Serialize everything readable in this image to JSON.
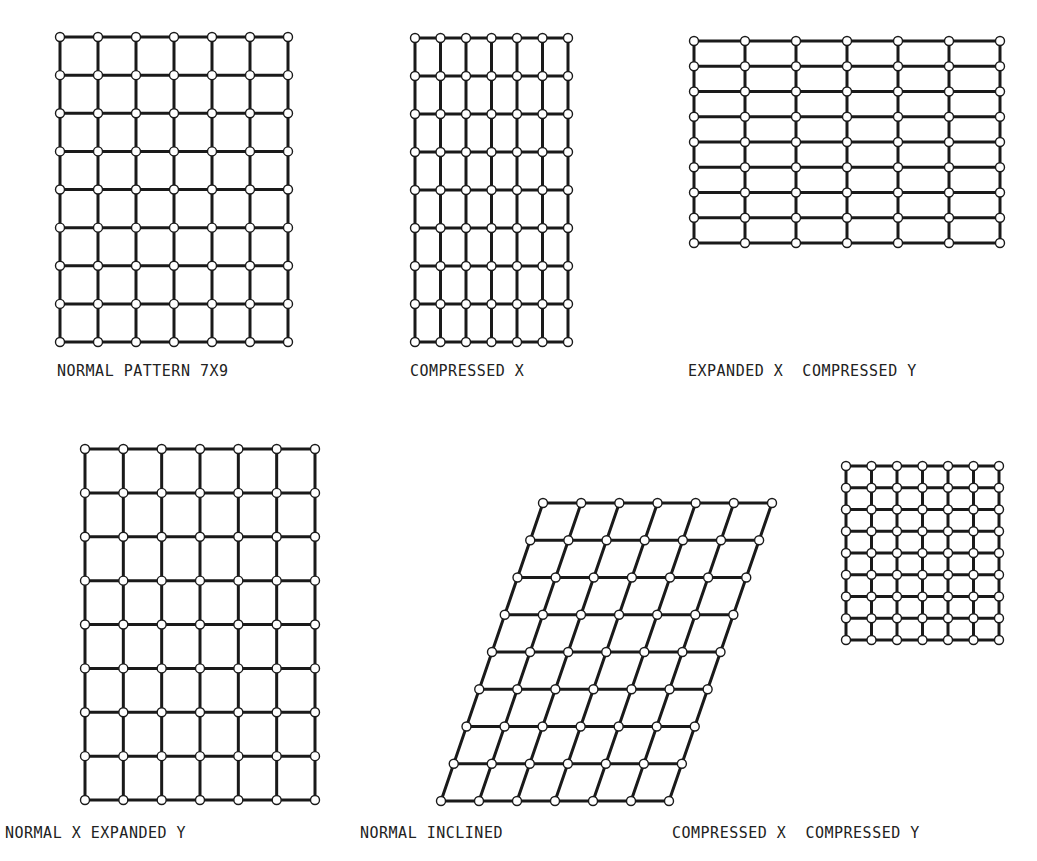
{
  "figure": {
    "colors": {
      "line": "#1a1a1a",
      "dot_fill": "#ffffff",
      "background": "#ffffff"
    },
    "grid": {
      "cols": 7,
      "rows": 9
    },
    "panels": [
      {
        "id": "normal",
        "label": "NORMAL PATTERN 7X9",
        "top_left": [
          60,
          37
        ],
        "top_right": [
          288,
          37
        ],
        "bottom_left": [
          60,
          342
        ],
        "bottom_right": [
          288,
          342
        ],
        "label_pos": [
          57,
          362
        ]
      },
      {
        "id": "compressed-x",
        "label": "COMPRESSED X",
        "top_left": [
          415,
          38
        ],
        "top_right": [
          568,
          38
        ],
        "bottom_left": [
          415,
          342
        ],
        "bottom_right": [
          568,
          342
        ],
        "label_pos": [
          410,
          362
        ]
      },
      {
        "id": "expanded-x-compressed-y",
        "label": "EXPANDED X  COMPRESSED Y",
        "top_left": [
          694,
          41
        ],
        "top_right": [
          1000,
          41
        ],
        "bottom_left": [
          694,
          243
        ],
        "bottom_right": [
          1000,
          243
        ],
        "label_pos": [
          688,
          362
        ]
      },
      {
        "id": "normal-x-expanded-y",
        "label": "NORMAL X EXPANDED Y",
        "top_left": [
          85,
          449
        ],
        "top_right": [
          315,
          449
        ],
        "bottom_left": [
          85,
          800
        ],
        "bottom_right": [
          315,
          800
        ],
        "label_pos": [
          5,
          824
        ]
      },
      {
        "id": "normal-inclined",
        "label": "NORMAL INCLINED",
        "top_left": [
          543,
          503
        ],
        "top_right": [
          772,
          503
        ],
        "bottom_left": [
          441,
          801
        ],
        "bottom_right": [
          669,
          801
        ],
        "label_pos": [
          360,
          824
        ]
      },
      {
        "id": "compressed-x-compressed-y",
        "label": "COMPRESSED X  COMPRESSED Y",
        "top_left": [
          846,
          466
        ],
        "top_right": [
          999,
          466
        ],
        "bottom_left": [
          846,
          640
        ],
        "bottom_right": [
          999,
          640
        ],
        "label_pos": [
          672,
          824
        ]
      }
    ]
  }
}
